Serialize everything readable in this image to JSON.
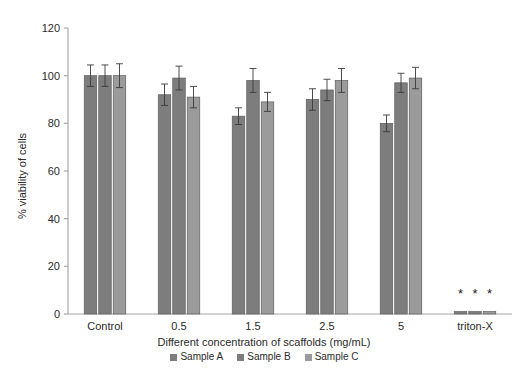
{
  "chart_data": {
    "type": "bar",
    "title": "",
    "xlabel": "Different concentration of scaffolds (mg/mL)",
    "ylabel": "% viability of cells",
    "categories": [
      "Control",
      "0.5",
      "1.5",
      "2.5",
      "5",
      "triton-X"
    ],
    "ylim": [
      0,
      120
    ],
    "yticks": [
      0,
      20,
      40,
      60,
      80,
      100,
      120
    ],
    "grid": false,
    "legend_position": "bottom-center",
    "series": [
      {
        "name": "Sample A",
        "color": "#7d7d7d",
        "values": [
          100,
          92,
          83,
          90,
          80,
          1
        ],
        "errors": [
          4.5,
          4.5,
          3.5,
          4.5,
          3.5,
          0.6
        ]
      },
      {
        "name": "Sample B",
        "color": "#7d7d7d",
        "values": [
          100,
          99,
          98,
          94,
          97,
          1
        ],
        "errors": [
          4.5,
          5.0,
          5.0,
          4.5,
          4.0,
          0.6
        ]
      },
      {
        "name": "Sample C",
        "color": "#9b9b9b",
        "values": [
          100,
          91,
          89,
          98,
          99,
          1
        ],
        "errors": [
          5.0,
          4.5,
          4.0,
          5.0,
          4.5,
          0.6
        ]
      }
    ],
    "annotations": [
      {
        "text": "*",
        "category": "triton-X",
        "series": "Sample A"
      },
      {
        "text": "*",
        "category": "triton-X",
        "series": "Sample B"
      },
      {
        "text": "*",
        "category": "triton-X",
        "series": "Sample C"
      }
    ]
  },
  "legend": {
    "items": [
      {
        "label": "Sample A",
        "color": "#7d7d7d"
      },
      {
        "label": "Sample B",
        "color": "#7d7d7d"
      },
      {
        "label": "Sample C",
        "color": "#9b9b9b"
      }
    ]
  },
  "axis": {
    "y_title": "% viability of cells",
    "x_title": "Different concentration of scaffolds (mg/mL)",
    "y_tick_labels": [
      "0",
      "20",
      "40",
      "60",
      "80",
      "100",
      "120"
    ],
    "x_tick_labels": [
      "Control",
      "0.5",
      "1.5",
      "2.5",
      "5",
      "triton-X"
    ],
    "axis_color": "#a8a8a8"
  },
  "colors": {
    "background": "#ffffff",
    "bar_dark": "#7d7d7d",
    "bar_light": "#9b9b9b",
    "bar_edge": "#5e5e5e",
    "error_bar": "#3a3a3a",
    "text": "#2b2b2b"
  }
}
